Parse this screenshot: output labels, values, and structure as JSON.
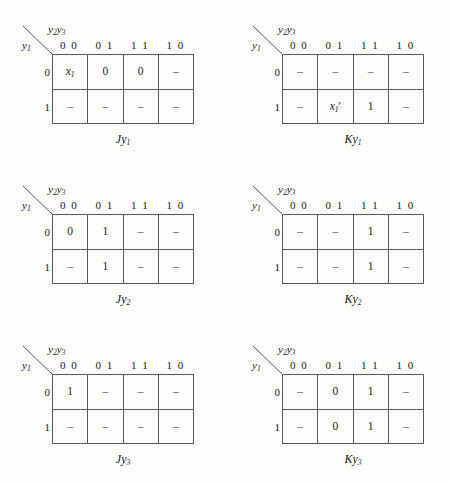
{
  "figure": {
    "background_color": "#fdfdfb",
    "line_color": "#55565a",
    "column_variable_label": "y2y3",
    "row_variable_label": "y1",
    "column_headers": [
      "0 0",
      "0 1",
      "1 1",
      "1 0"
    ],
    "row_headers": [
      "0",
      "1"
    ],
    "dash_symbol": "–"
  },
  "maps": [
    {
      "id": "jy1",
      "caption": "Jy1",
      "caption_main": "J",
      "caption_var": "y",
      "caption_sub": "1",
      "rows": [
        {
          "label": "0",
          "cells": [
            "x1",
            "0",
            "0",
            "–"
          ]
        },
        {
          "label": "1",
          "cells": [
            "–",
            "–",
            "–",
            "–"
          ]
        }
      ]
    },
    {
      "id": "ky1",
      "caption": "Ky1",
      "caption_main": "K",
      "caption_var": "y",
      "caption_sub": "1",
      "rows": [
        {
          "label": "0",
          "cells": [
            "–",
            "–",
            "–",
            "–"
          ]
        },
        {
          "label": "1",
          "cells": [
            "–",
            "x1'",
            "1",
            "–"
          ]
        }
      ]
    },
    {
      "id": "jy2",
      "caption": "Jy2",
      "caption_main": "J",
      "caption_var": "y",
      "caption_sub": "2",
      "rows": [
        {
          "label": "0",
          "cells": [
            "0",
            "1",
            "–",
            "–"
          ]
        },
        {
          "label": "1",
          "cells": [
            "–",
            "1",
            "–",
            "–"
          ]
        }
      ]
    },
    {
      "id": "ky2",
      "caption": "Ky2",
      "caption_main": "K",
      "caption_var": "y",
      "caption_sub": "2",
      "rows": [
        {
          "label": "0",
          "cells": [
            "–",
            "–",
            "1",
            "–"
          ]
        },
        {
          "label": "1",
          "cells": [
            "–",
            "–",
            "1",
            "–"
          ]
        }
      ]
    },
    {
      "id": "jy3",
      "caption": "Jy3",
      "caption_main": "J",
      "caption_var": "y",
      "caption_sub": "3",
      "rows": [
        {
          "label": "0",
          "cells": [
            "1",
            "–",
            "–",
            "–"
          ]
        },
        {
          "label": "1",
          "cells": [
            "–",
            "–",
            "–",
            "–"
          ]
        }
      ]
    },
    {
      "id": "ky3",
      "caption": "Ky3",
      "caption_main": "K",
      "caption_var": "y",
      "caption_sub": "3",
      "rows": [
        {
          "label": "0",
          "cells": [
            "–",
            "0",
            "1",
            "–"
          ]
        },
        {
          "label": "1",
          "cells": [
            "–",
            "0",
            "1",
            "–"
          ]
        }
      ]
    }
  ]
}
